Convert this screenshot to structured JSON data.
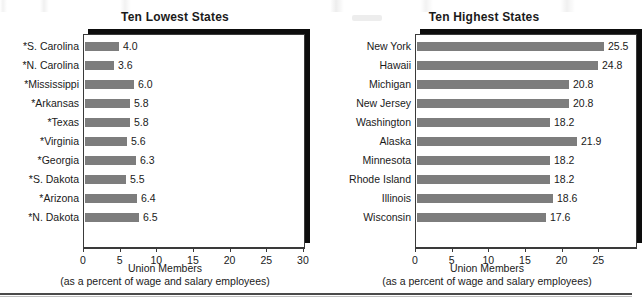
{
  "figure": {
    "axis_caption_line1": "Union Members",
    "axis_caption_line2": "(as a percent of wage and salary employees)"
  },
  "chart_data": [
    {
      "type": "bar",
      "orientation": "horizontal",
      "title": "Ten Lowest States",
      "xlabel": "Union Members (as a percent of wage and salary employees)",
      "ylabel": "",
      "xlim": [
        0,
        30
      ],
      "grid": false,
      "legend": "none",
      "tick_labels": [
        "0",
        "5",
        "10",
        "15",
        "20",
        "25",
        "30"
      ],
      "ticks": [
        0,
        5,
        10,
        15,
        20,
        25,
        30
      ],
      "categories": [
        "*S. Carolina",
        "*N. Carolina",
        "*Mississippi",
        "*Arkansas",
        "*Texas",
        "*Virginia",
        "*Georgia",
        "*S. Dakota",
        "*Arizona",
        "*N. Dakota"
      ],
      "values": [
        4.0,
        3.6,
        6.0,
        5.8,
        5.8,
        5.6,
        6.3,
        5.5,
        6.4,
        6.5
      ],
      "value_labels": [
        "4.0",
        "3.6",
        "6.0",
        "5.8",
        "5.8",
        "5.6",
        "6.3",
        "5.5",
        "6.4",
        "6.5"
      ],
      "bar_pixel_lengths": [
        34,
        29,
        49,
        45,
        45,
        42,
        51,
        41,
        52,
        54
      ]
    },
    {
      "type": "bar",
      "orientation": "horizontal",
      "title": "Ten Highest States",
      "xlabel": "Union Members (as a percent of wage and salary employees)",
      "ylabel": "",
      "xlim": [
        0,
        30
      ],
      "grid": false,
      "legend": "none",
      "tick_labels": [
        "0",
        "5",
        "10",
        "15",
        "20",
        "25"
      ],
      "ticks": [
        0,
        5,
        10,
        15,
        20,
        25
      ],
      "categories": [
        "New York",
        "Hawaii",
        "Michigan",
        "New Jersey",
        "Washington",
        "Alaska",
        "Minnesota",
        "Rhode Island",
        "Illinois",
        "Wisconsin"
      ],
      "values": [
        25.5,
        24.8,
        20.8,
        20.8,
        18.2,
        21.9,
        18.2,
        18.2,
        18.6,
        17.6
      ],
      "value_labels": [
        "25.5",
        "24.8",
        "20.8",
        "20.8",
        "18.2",
        "21.9",
        "18.2",
        "18.2",
        "18.6",
        "17.6"
      ],
      "bar_pixel_lengths": [
        187,
        181,
        152,
        152,
        133,
        160,
        133,
        133,
        136,
        129
      ]
    }
  ],
  "colors": {
    "bar_fill": "#7d7d7d",
    "frame": "#3a3a3a",
    "shadow": "#0d0d0d",
    "text": "#1a1a1a",
    "background": "#ffffff"
  }
}
